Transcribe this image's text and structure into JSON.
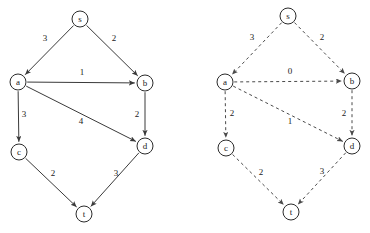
{
  "figure": {
    "title": "",
    "width": 370,
    "height": 233,
    "background_color": "#ffffff",
    "node_stroke_color": "#2b2b2b",
    "solid_edge_color": "#3a3a3a",
    "dashed_edge_color": "#4a4a4a",
    "node_radius": 8
  },
  "graphs": [
    {
      "id": "left-graph",
      "name": "left-graph",
      "edge_style": "solid",
      "nodes": [
        {
          "id": "s",
          "label": "s",
          "x": 80,
          "y": 19
        },
        {
          "id": "a",
          "label": "a",
          "x": 18,
          "y": 82
        },
        {
          "id": "b",
          "label": "b",
          "x": 145,
          "y": 83
        },
        {
          "id": "c",
          "label": "c",
          "x": 19,
          "y": 152
        },
        {
          "id": "d",
          "label": "d",
          "x": 145,
          "y": 146
        },
        {
          "id": "t",
          "label": "t",
          "x": 84,
          "y": 214
        }
      ],
      "edges": [
        {
          "from": "s",
          "to": "a",
          "weight": "3",
          "label_x": 45,
          "label_y": 39
        },
        {
          "from": "s",
          "to": "b",
          "weight": "2",
          "label_x": 114,
          "label_y": 39
        },
        {
          "from": "a",
          "to": "b",
          "weight": "1",
          "label_x": 82,
          "label_y": 73
        },
        {
          "from": "a",
          "to": "c",
          "weight": "3",
          "label_x": 24,
          "label_y": 115
        },
        {
          "from": "a",
          "to": "d",
          "weight": "4",
          "label_x": 81,
          "label_y": 122
        },
        {
          "from": "b",
          "to": "d",
          "weight": "2",
          "label_x": 137,
          "label_y": 115
        },
        {
          "from": "c",
          "to": "t",
          "weight": "2",
          "label_x": 53,
          "label_y": 174
        },
        {
          "from": "d",
          "to": "t",
          "weight": "3",
          "label_x": 116,
          "label_y": 174
        }
      ]
    },
    {
      "id": "right-graph",
      "name": "right-graph",
      "edge_style": "dashed",
      "nodes": [
        {
          "id": "s",
          "label": "s",
          "x": 288,
          "y": 16
        },
        {
          "id": "a",
          "label": "a",
          "x": 225,
          "y": 82
        },
        {
          "id": "b",
          "label": "b",
          "x": 352,
          "y": 81
        },
        {
          "id": "c",
          "label": "c",
          "x": 226,
          "y": 148
        },
        {
          "id": "d",
          "label": "d",
          "x": 352,
          "y": 146
        },
        {
          "id": "t",
          "label": "t",
          "x": 291,
          "y": 212
        }
      ],
      "edges": [
        {
          "from": "s",
          "to": "a",
          "weight": "3",
          "label_x": 252,
          "label_y": 38
        },
        {
          "from": "s",
          "to": "b",
          "weight": "2",
          "label_x": 322,
          "label_y": 38
        },
        {
          "from": "a",
          "to": "b",
          "weight": "0",
          "label_x": 290,
          "label_y": 72
        },
        {
          "from": "a",
          "to": "c",
          "weight": "2",
          "label_x": 232,
          "label_y": 114
        },
        {
          "from": "a",
          "to": "d",
          "weight": "1",
          "label_x": 290,
          "label_y": 122
        },
        {
          "from": "b",
          "to": "d",
          "weight": "2",
          "label_x": 344,
          "label_y": 114
        },
        {
          "from": "c",
          "to": "t",
          "weight": "2",
          "label_x": 261,
          "label_y": 173
        },
        {
          "from": "d",
          "to": "t",
          "weight": "3",
          "label_x": 322,
          "label_y": 172
        }
      ]
    }
  ]
}
